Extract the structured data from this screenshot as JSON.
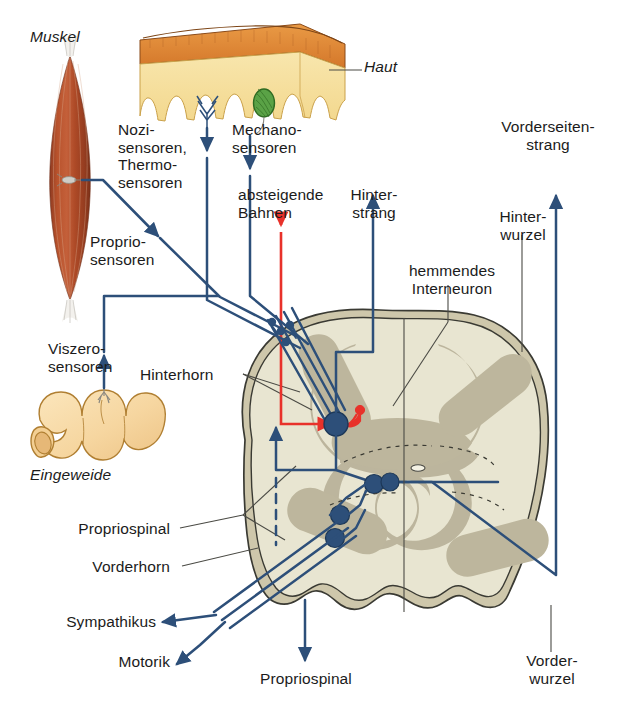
{
  "figure": {
    "type": "anatomical-diagram",
    "language": "de"
  },
  "labels": {
    "muskel": "Muskel",
    "haut": "Haut",
    "nozi_thermo": "Nozi-\nsensoren,\nThermo-\nsensoren",
    "mechano": "Mechano-\nsensoren",
    "absteigende_bahnen": "absteigende\nBahnen",
    "hinterstrang": "Hinter-\nstrang",
    "vorderseitenstrang": "Vorderseiten-\nstrang",
    "hinterwurzel": "Hinter-\nwurzel",
    "hemmendes_interneuron": "hemmendes\nInterneuron",
    "propriosensoren": "Proprio-\nsensoren",
    "viszerosensoren": "Viszero-\nsensoren",
    "hinterhorn": "Hinterhorn",
    "eingeweide": "Eingeweide",
    "propriospinal_links": "Propriospinal",
    "vorderhorn": "Vorderhorn",
    "sympathikus": "Sympathikus",
    "motorik": "Motorik",
    "propriospinal_unten": "Propriospinal",
    "vorderwurzel": "Vorder-\nwurzel"
  },
  "colors": {
    "afferent_blue": "#2d4f79",
    "descending_red": "#e8312a",
    "white_matter": "#e5e2cd",
    "gray_matter": "#bdb69c",
    "cord_rim": "#c9c3a8",
    "skin_epidermis": "#e28c33",
    "skin_dermis": "#f5dc9a",
    "muscle": "#b1472a",
    "gut": "#f6d9a4",
    "mechanoreceptor": "#4e9c3a",
    "leader_line": "#3b3b3b",
    "text": "#1b1b1b"
  },
  "elements": {
    "arrows": [
      {
        "name": "nozi-thermo-afferent-arrow",
        "direction": "down"
      },
      {
        "name": "mechano-afferent-arrow",
        "direction": "down"
      },
      {
        "name": "absteigende-bahnen-arrow",
        "direction": "down",
        "color": "red"
      },
      {
        "name": "hinterstrang-arrow",
        "direction": "up"
      },
      {
        "name": "vorderseitenstrang-arrow",
        "direction": "up"
      },
      {
        "name": "propriosensoren-arrow",
        "direction": "down-right"
      },
      {
        "name": "viszerosensoren-arrow",
        "direction": "up"
      },
      {
        "name": "sympathikus-arrow",
        "direction": "left"
      },
      {
        "name": "motorik-arrow",
        "direction": "down-left"
      },
      {
        "name": "propriospinal-down-arrow",
        "direction": "down"
      },
      {
        "name": "propriospinal-up-arrow",
        "direction": "up"
      }
    ],
    "neurons": [
      {
        "name": "hinterhorn-projection-neuron",
        "color": "blue"
      },
      {
        "name": "hemmendes-interneuron",
        "color": "red"
      },
      {
        "name": "motoneuron-alpha",
        "color": "blue"
      },
      {
        "name": "motoneuron-gamma",
        "color": "blue"
      },
      {
        "name": "sympathisches-neuron",
        "color": "blue"
      },
      {
        "name": "kommissurales-neuron",
        "color": "blue"
      }
    ]
  }
}
